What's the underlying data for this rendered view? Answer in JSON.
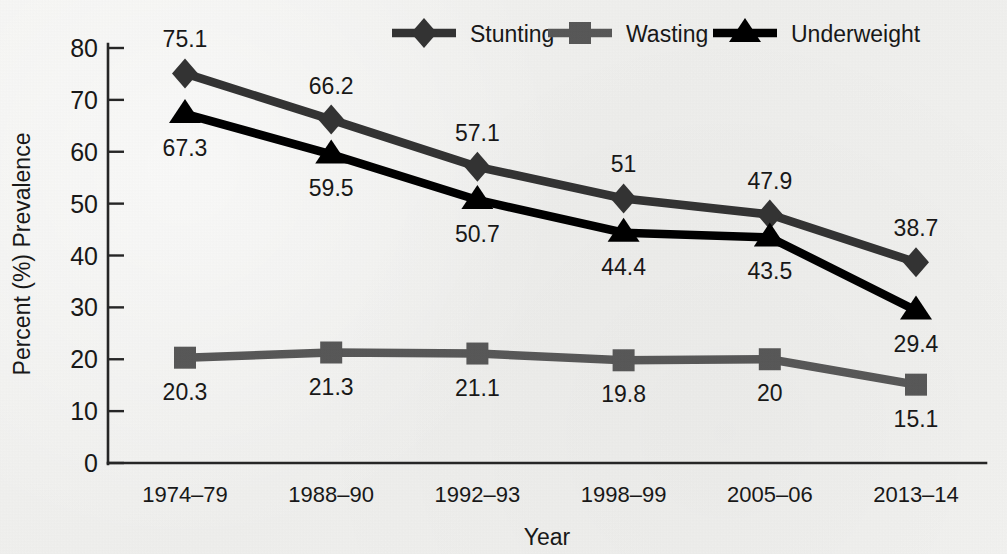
{
  "chart_data": {
    "type": "line",
    "title": "",
    "xlabel": "Year",
    "ylabel": "Percent (%) Prevalence",
    "categories": [
      "1974–79",
      "1988–90",
      "1992–93",
      "1998–99",
      "2005–06",
      "2013–14"
    ],
    "ylim": [
      0,
      80
    ],
    "yticks": [
      0,
      10,
      20,
      30,
      40,
      50,
      60,
      70,
      80
    ],
    "ytick_labels": [
      "0",
      "10",
      "20",
      "30",
      "40",
      "50",
      "60",
      "70",
      "80"
    ],
    "grid": false,
    "legend_position": "top",
    "series": [
      {
        "name": "Stunting",
        "marker": "diamond",
        "color": "#333333",
        "values": [
          75.1,
          66.2,
          57.1,
          51,
          47.9,
          38.7
        ],
        "labels": [
          "75.1",
          "66.2",
          "57.1",
          "51",
          "47.9",
          "38.7"
        ],
        "label_side": [
          "above",
          "above",
          "above",
          "above",
          "above",
          "above"
        ]
      },
      {
        "name": "Wasting",
        "marker": "square",
        "color": "#585858",
        "values": [
          20.3,
          21.3,
          21.1,
          19.8,
          20,
          15.1
        ],
        "labels": [
          "20.3",
          "21.3",
          "21.1",
          "19.8",
          "20",
          "15.1"
        ],
        "label_side": [
          "below",
          "below",
          "below",
          "below",
          "below",
          "below"
        ]
      },
      {
        "name": "Underweight",
        "marker": "triangle",
        "color": "#000000",
        "values": [
          67.3,
          59.5,
          50.7,
          44.4,
          43.5,
          29.4
        ],
        "labels": [
          "67.3",
          "59.5",
          "50.7",
          "44.4",
          "43.5",
          "29.4"
        ],
        "label_side": [
          "below",
          "below",
          "below",
          "below",
          "below",
          "below"
        ]
      }
    ]
  },
  "legend": {
    "entries": [
      {
        "label": "Stunting",
        "marker": "diamond-marker-icon",
        "color": "#333333"
      },
      {
        "label": "Wasting",
        "marker": "square-marker-icon",
        "color": "#585858"
      },
      {
        "label": "Underweight",
        "marker": "triangle-marker-icon",
        "color": "#000000"
      }
    ]
  },
  "axes": {
    "y_title": "Percent (%) Prevalence",
    "x_title": "Year"
  }
}
